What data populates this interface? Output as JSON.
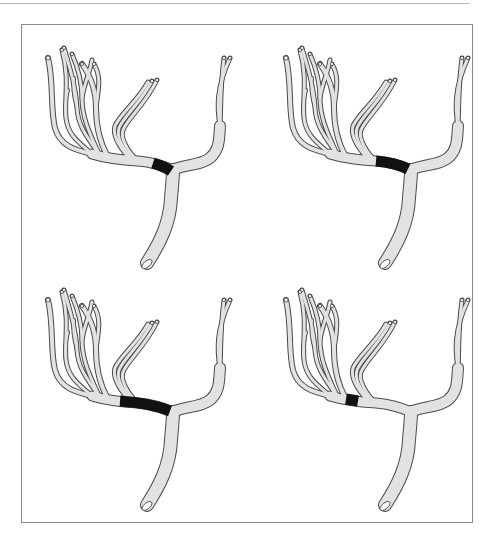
{
  "figure": {
    "colors": {
      "vessel_fill": "#e2e2e2",
      "vessel_outline": "#4a4a4a",
      "occlusion": "#111111",
      "frame": "#8a8a8a",
      "background": "#ffffff"
    },
    "panels": [
      {
        "id": "top-left",
        "occlusion": "short segment just proximal to bifurcation"
      },
      {
        "id": "top-right",
        "occlusion": "longer segment proximal to bifurcation"
      },
      {
        "id": "bottom-left",
        "occlusion": "long segment spanning branch origins"
      },
      {
        "id": "bottom-right",
        "occlusion": "short segment distal, between branch origins"
      }
    ]
  }
}
